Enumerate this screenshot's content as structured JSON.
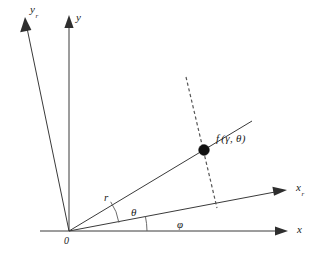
{
  "figure": {
    "background_color": "#ffffff",
    "line_color": "#3a3a3a",
    "dash_color": "#555555",
    "point_color": "#111111",
    "width": 316,
    "height": 263
  },
  "labels": {
    "y_rotated": "y",
    "y_rotated_sub": "r",
    "y_axis": "y",
    "x_rotated": "x",
    "x_rotated_sub": "r",
    "x_axis": "x",
    "origin": "0",
    "radius": "r",
    "theta": "θ",
    "phi": "φ",
    "point": "f (γ, θ)",
    "point_fn": "f",
    "point_args": "(γ, θ)"
  },
  "geometry": {
    "origin": {
      "x": 69,
      "y": 231
    },
    "point": {
      "x": 204,
      "y": 150
    },
    "rays": [
      {
        "name": "y-rotated-axis",
        "to_x": 22,
        "to_y": 22
      },
      {
        "name": "y-axis",
        "to_x": 69,
        "to_y": 20
      },
      {
        "name": "r-ray",
        "to_x": 250,
        "to_y": 122
      },
      {
        "name": "x-rotated-axis",
        "to_x": 285,
        "to_y": 189
      },
      {
        "name": "x-axis",
        "to_x": 285,
        "to_y": 231
      }
    ],
    "dashed_segment": {
      "x1": 187,
      "y1": 78,
      "x2": 216,
      "y2": 207
    },
    "arcs": {
      "phi_radius": 78,
      "theta_radius": 50
    }
  }
}
